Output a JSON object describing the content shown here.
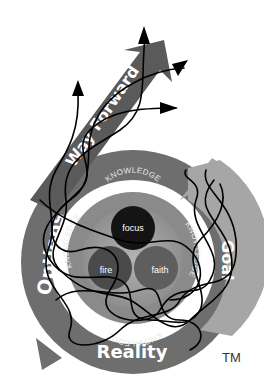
{
  "diagram": {
    "stages": {
      "goal": "Goal",
      "reality": "Reality",
      "options": "Options",
      "way_forward": "Way Forward"
    },
    "ring_label": "KNOWLEDGE",
    "ring_labels": [
      "KNOWLEDGE",
      "KNOWLEDGE",
      "KNOWLEDGE",
      "KNOWLEDGE"
    ],
    "core": {
      "top": "focus",
      "left": "fire",
      "right": "faith"
    },
    "trademark": "TM",
    "overlay": "tangled black lines ending in four arrowheads",
    "colors": {
      "outer_ring": "#6e6e6e",
      "goal_arrow": "#a6a6a6",
      "way_forward_arrow": "#5a5a5a",
      "knowledge_ring": "#8a8a8a",
      "inner_disc": "#9d9d9d",
      "focus": "#141414",
      "fire": "#4a4a4a",
      "faith": "#5e5e5e",
      "lines": "#000000"
    }
  }
}
